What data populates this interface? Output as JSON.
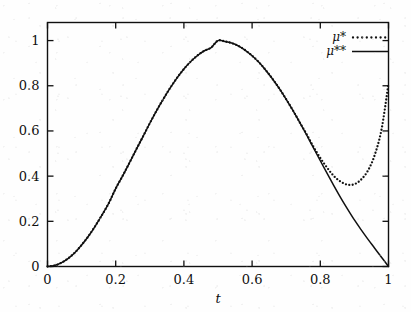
{
  "chart_data": {
    "type": "line",
    "title": "",
    "subtitle": "",
    "xlabel": "t",
    "ylabel": "",
    "xlim": [
      0,
      1
    ],
    "ylim": [
      0,
      1.08
    ],
    "grid": false,
    "legend_position": "top-right",
    "xticks": [
      "0",
      "0.2",
      "0.4",
      "0.6",
      "0.8",
      "1"
    ],
    "xtick_values": [
      0,
      0.2,
      0.4,
      0.6,
      0.8,
      1
    ],
    "yticks": [
      "0",
      "0.2",
      "0.4",
      "0.6",
      "0.8",
      "1"
    ],
    "ytick_values": [
      0,
      0.2,
      0.4,
      0.6,
      0.8,
      1
    ],
    "series": [
      {
        "name": "μ*",
        "style": "dotted",
        "color": "#101010",
        "x": [
          0.0,
          0.02,
          0.04,
          0.06,
          0.08,
          0.1,
          0.12,
          0.14,
          0.16,
          0.18,
          0.2,
          0.22,
          0.24,
          0.26,
          0.28,
          0.3,
          0.32,
          0.34,
          0.36,
          0.38,
          0.4,
          0.42,
          0.44,
          0.46,
          0.48,
          0.5,
          0.52,
          0.54,
          0.56,
          0.58,
          0.6,
          0.62,
          0.64,
          0.66,
          0.68,
          0.7,
          0.72,
          0.74,
          0.76,
          0.78,
          0.8,
          0.82,
          0.84,
          0.86,
          0.88,
          0.9,
          0.92,
          0.94,
          0.96,
          0.98,
          1.0
        ],
        "y": [
          0.0,
          0.004,
          0.016,
          0.035,
          0.061,
          0.095,
          0.134,
          0.179,
          0.228,
          0.281,
          0.345,
          0.4,
          0.458,
          0.517,
          0.575,
          0.634,
          0.69,
          0.742,
          0.791,
          0.835,
          0.874,
          0.907,
          0.934,
          0.955,
          0.969,
          1.0,
          0.996,
          0.989,
          0.976,
          0.957,
          0.933,
          0.904,
          0.869,
          0.83,
          0.787,
          0.74,
          0.69,
          0.637,
          0.585,
          0.53,
          0.48,
          0.437,
          0.4,
          0.375,
          0.362,
          0.364,
          0.385,
          0.425,
          0.495,
          0.61,
          0.81
        ]
      },
      {
        "name": "μ**",
        "style": "solid",
        "color": "#101010",
        "x": [
          0.0,
          0.02,
          0.04,
          0.06,
          0.08,
          0.1,
          0.12,
          0.14,
          0.16,
          0.18,
          0.2,
          0.22,
          0.24,
          0.26,
          0.28,
          0.3,
          0.32,
          0.34,
          0.36,
          0.38,
          0.4,
          0.42,
          0.44,
          0.46,
          0.48,
          0.5,
          0.52,
          0.54,
          0.56,
          0.58,
          0.6,
          0.62,
          0.64,
          0.66,
          0.68,
          0.7,
          0.72,
          0.74,
          0.76,
          0.78,
          0.8,
          0.82,
          0.84,
          0.86,
          0.88,
          0.9,
          0.92,
          0.94,
          0.96,
          0.98,
          1.0
        ],
        "y": [
          0.0,
          0.004,
          0.016,
          0.035,
          0.061,
          0.095,
          0.134,
          0.179,
          0.228,
          0.281,
          0.345,
          0.4,
          0.458,
          0.517,
          0.575,
          0.634,
          0.69,
          0.742,
          0.791,
          0.835,
          0.874,
          0.907,
          0.934,
          0.955,
          0.969,
          1.0,
          0.996,
          0.989,
          0.976,
          0.957,
          0.933,
          0.904,
          0.869,
          0.83,
          0.787,
          0.74,
          0.69,
          0.637,
          0.582,
          0.525,
          0.468,
          0.412,
          0.357,
          0.304,
          0.254,
          0.206,
          0.162,
          0.12,
          0.08,
          0.04,
          0.0
        ]
      }
    ],
    "annotations": []
  },
  "legend": {
    "entries": [
      {
        "label": "μ*",
        "style": "dotted"
      },
      {
        "label": "μ**",
        "style": "solid"
      }
    ]
  },
  "axes": {
    "x_label": "t",
    "x_tick_labels": [
      "0",
      "0.2",
      "0.4",
      "0.6",
      "0.8",
      "1"
    ],
    "y_tick_labels": [
      "0",
      "0.2",
      "0.4",
      "0.6",
      "0.8",
      "1"
    ]
  },
  "colors": {
    "ink": "#101010",
    "background": "#fefefe"
  }
}
